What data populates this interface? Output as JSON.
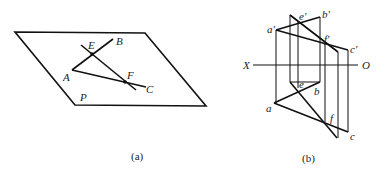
{
  "figure_a": {
    "caption": "(a)",
    "plane_label": "P",
    "points": {
      "A": "A",
      "B": "B",
      "C": "C",
      "E": "E",
      "F": "F"
    }
  },
  "figure_b": {
    "caption": "(b)",
    "axis": {
      "left": "X",
      "right": "O"
    },
    "front_view": {
      "a": "a'",
      "b": "b'",
      "c": "c'",
      "e": "e'",
      "f": "f'"
    },
    "top_view": {
      "a": "a",
      "b": "b",
      "c": "c",
      "e": "e",
      "f": "f"
    }
  },
  "colors": {
    "line": "#111111",
    "background": "#ffffff"
  }
}
